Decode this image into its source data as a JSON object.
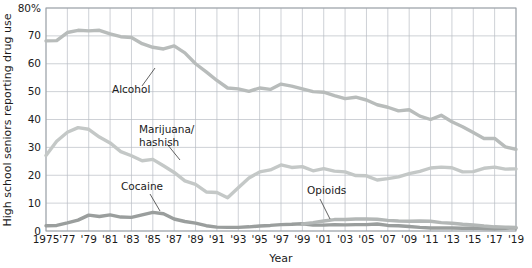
{
  "chart_data": {
    "type": "line",
    "title": "",
    "xlabel": "Year",
    "ylabel": "High school seniors reporting drug use",
    "xlim": [
      1975,
      2019
    ],
    "ylim": [
      0,
      80
    ],
    "yticks": [
      0,
      10,
      20,
      30,
      40,
      50,
      60,
      70,
      80
    ],
    "ytick_labels": [
      "0",
      "10",
      "20",
      "30",
      "40",
      "50",
      "60",
      "70",
      "80%"
    ],
    "xticks": [
      1975,
      1977,
      1979,
      1981,
      1983,
      1985,
      1987,
      1989,
      1991,
      1993,
      1995,
      1997,
      1999,
      2001,
      2003,
      2005,
      2007,
      2009,
      2011,
      2013,
      2015,
      2017,
      2019
    ],
    "xtick_labels": [
      "1975",
      "'77",
      "'79",
      "'81",
      "'83",
      "'85",
      "'87",
      "'89",
      "'91",
      "'93",
      "'95",
      "'97",
      "'99",
      "'01",
      "'03",
      "'05",
      "'07",
      "'09",
      "'11",
      "'13",
      "'15",
      "'17",
      "'19"
    ],
    "grid": true,
    "legend_position": "inline-annotations",
    "x": [
      1975,
      1976,
      1977,
      1978,
      1979,
      1980,
      1981,
      1982,
      1983,
      1984,
      1985,
      1986,
      1987,
      1988,
      1989,
      1990,
      1991,
      1992,
      1993,
      1994,
      1995,
      1996,
      1997,
      1998,
      1999,
      2000,
      2001,
      2002,
      2003,
      2004,
      2005,
      2006,
      2007,
      2008,
      2009,
      2010,
      2011,
      2012,
      2013,
      2014,
      2015,
      2016,
      2017,
      2018,
      2019
    ],
    "series": [
      {
        "name": "Alcohol",
        "color": "#b8bcbb",
        "values": [
          68.2,
          68.3,
          71.2,
          72.0,
          71.8,
          72.0,
          70.7,
          69.7,
          69.4,
          67.2,
          65.9,
          65.3,
          66.4,
          63.9,
          60.0,
          57.1,
          54.0,
          51.3,
          51.0,
          50.1,
          51.3,
          50.8,
          52.7,
          52.0,
          51.0,
          50.0,
          49.8,
          48.6,
          47.5,
          48.0,
          47.0,
          45.3,
          44.4,
          43.1,
          43.5,
          41.2,
          40.0,
          41.5,
          39.2,
          37.4,
          35.3,
          33.2,
          33.2,
          30.2,
          29.3
        ]
      },
      {
        "name": "Marijuana/hashish",
        "color": "#c4c8c7",
        "values": [
          27.1,
          32.2,
          35.4,
          37.1,
          36.5,
          33.7,
          31.6,
          28.5,
          27.0,
          25.2,
          25.7,
          23.4,
          21.0,
          18.0,
          16.7,
          14.0,
          13.8,
          11.9,
          15.5,
          19.0,
          21.2,
          21.9,
          23.7,
          22.8,
          23.1,
          21.6,
          22.4,
          21.5,
          21.2,
          19.9,
          19.8,
          18.3,
          18.8,
          19.4,
          20.6,
          21.4,
          22.6,
          22.9,
          22.7,
          21.2,
          21.3,
          22.5,
          22.9,
          22.2,
          22.3
        ]
      },
      {
        "name": "Cocaine",
        "color": "#9a9e9d",
        "values": [
          1.9,
          2.0,
          2.9,
          3.9,
          5.7,
          5.2,
          5.8,
          5.0,
          4.9,
          5.8,
          6.7,
          6.2,
          4.3,
          3.4,
          2.8,
          1.9,
          1.4,
          1.3,
          1.3,
          1.5,
          1.8,
          2.0,
          2.3,
          2.4,
          2.6,
          2.1,
          2.1,
          2.3,
          2.2,
          2.3,
          2.3,
          2.5,
          2.0,
          1.9,
          1.6,
          1.3,
          1.1,
          1.1,
          1.1,
          1.0,
          1.1,
          0.9,
          0.8,
          1.0,
          1.1
        ]
      },
      {
        "name": "Opioids",
        "color": "#b3b7b6",
        "values": [
          null,
          null,
          null,
          null,
          null,
          null,
          null,
          null,
          null,
          null,
          null,
          null,
          null,
          null,
          null,
          null,
          null,
          null,
          null,
          null,
          null,
          null,
          null,
          null,
          2.5,
          3.0,
          3.6,
          4.1,
          4.1,
          4.3,
          4.3,
          4.2,
          3.8,
          3.6,
          3.5,
          3.6,
          3.5,
          3.0,
          2.8,
          2.4,
          2.2,
          1.8,
          1.5,
          1.4,
          1.3
        ]
      }
    ],
    "annotations": [
      {
        "text": "Alcohol",
        "x": 112,
        "y": 93,
        "leader": {
          "x1": 142,
          "y1": 86,
          "x2": 155,
          "y2": 68
        }
      },
      {
        "text": "Marijuana/",
        "x": 139,
        "y": 133,
        "leader": {
          "x1": 167,
          "y1": 144,
          "x2": 180,
          "y2": 160
        }
      },
      {
        "text": "hashish",
        "x": 139,
        "y": 146,
        "leader": null
      },
      {
        "text": "Cocaine",
        "x": 121,
        "y": 190,
        "leader": {
          "x1": 150,
          "y1": 194,
          "x2": 160,
          "y2": 211
        }
      },
      {
        "text": "Opioids",
        "x": 307,
        "y": 194,
        "leader": {
          "x1": 320,
          "y1": 199,
          "x2": 330,
          "y2": 219
        }
      }
    ],
    "style": {
      "grid_color": "#b9bdc4",
      "border_color": "#9aa0a6",
      "background": "#ffffff",
      "text_color": "#1b1b1b"
    }
  }
}
